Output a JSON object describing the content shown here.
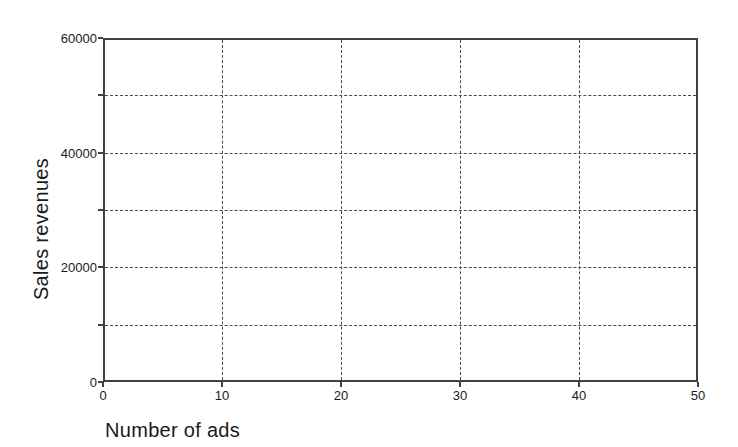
{
  "figure": {
    "background": "#ffffff",
    "axis_color": "#414141",
    "grid_color": "#4a4a4a",
    "text_color": "#1a1a1a"
  },
  "chart_data": {
    "type": "scatter",
    "title": "",
    "xlabel": "Number of ads",
    "ylabel": "Sales revenues",
    "xlim": [
      0,
      50
    ],
    "ylim": [
      0,
      60000
    ],
    "x_tick_values": [
      0,
      10,
      20,
      30,
      40,
      50
    ],
    "x_tick_labels": [
      "0",
      "10",
      "20",
      "30",
      "40",
      "50"
    ],
    "y_tick_values": [
      0,
      20000,
      40000,
      60000
    ],
    "y_tick_labels": [
      "0",
      "20000",
      "40000",
      "60000"
    ],
    "y_minor_tick_values": [
      10000,
      30000,
      50000
    ],
    "x_gridlines": [
      10,
      20,
      30,
      40
    ],
    "y_gridlines": [
      10000,
      20000,
      30000,
      40000,
      50000
    ],
    "grid_style": "dashed",
    "grid_on": true,
    "legend_position": "none",
    "series": [],
    "points": []
  }
}
